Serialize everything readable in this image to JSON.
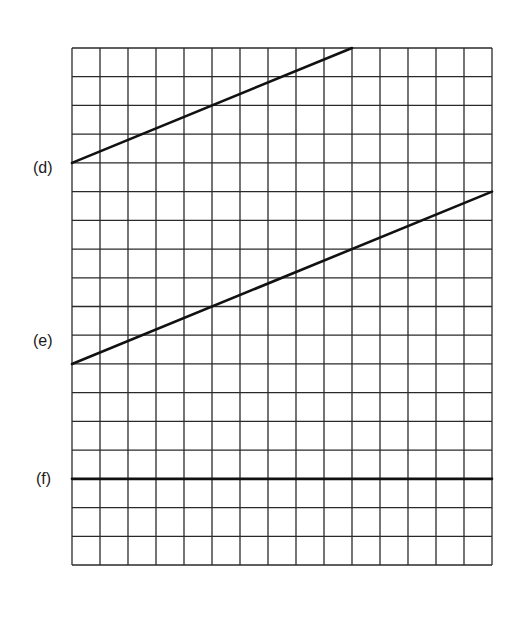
{
  "grid": {
    "columns": 15,
    "rows": 18,
    "left": 72,
    "top": 48,
    "width": 420,
    "height": 517,
    "line_color": "#2a2a2a",
    "trace_color": "#111111"
  },
  "traces": [
    {
      "label": "(d)",
      "start": {
        "col": 0,
        "row": 4
      },
      "end": {
        "col": 10,
        "row": 0
      }
    },
    {
      "label": "(e)",
      "start": {
        "col": 0,
        "row": 11
      },
      "end": {
        "col": 15,
        "row": 5
      }
    },
    {
      "label": "(f)",
      "start": {
        "col": 0,
        "row": 15
      },
      "end": {
        "col": 15,
        "row": 15
      }
    }
  ],
  "labels": {
    "d": "(d)",
    "e": "(e)",
    "f": "(f)"
  }
}
